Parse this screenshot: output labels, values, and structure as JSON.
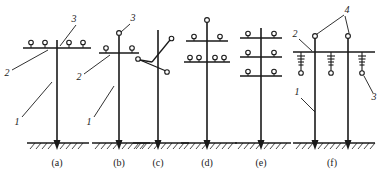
{
  "figure": {
    "stroke_color": "#1a1a1a",
    "background_color": "#ffffff",
    "insulator_fill": "#ffffff"
  },
  "callout_labels": {
    "pole": "1",
    "crossarm": "2",
    "pin_insulator": "3",
    "suspension_insulator_string": "3",
    "conductor_support": "4"
  },
  "panels": [
    {
      "id": "a",
      "caption": "(a)",
      "pole_count": 1,
      "crossarm_count": 1,
      "top_insulator": false,
      "insulator_total": 4,
      "crossarms": [
        {
          "level": 1,
          "insulators_left": 2,
          "insulators_right": 2
        }
      ],
      "callouts": [
        {
          "text": "1",
          "target": "pole"
        },
        {
          "text": "2",
          "target": "crossarm"
        },
        {
          "text": "3",
          "target": "pin-insulator"
        }
      ]
    },
    {
      "id": "b",
      "caption": "(b)",
      "pole_count": 1,
      "crossarm_count": 1,
      "top_insulator": true,
      "insulator_total": 3,
      "crossarms": [
        {
          "level": 1,
          "insulators_left": 1,
          "insulators_right": 1
        }
      ],
      "callouts": [
        {
          "text": "1",
          "target": "pole"
        },
        {
          "text": "2",
          "target": "crossarm"
        },
        {
          "text": "3",
          "target": "top-pin-insulator"
        }
      ]
    },
    {
      "id": "c",
      "caption": "(c)",
      "pole_count": 1,
      "crossarm_count": 0,
      "arm_type": "delta-angled-brackets",
      "insulator_total": 3,
      "arms": [
        {
          "position": "upper-right",
          "insulators": 1
        },
        {
          "position": "middle-left",
          "insulators": 1
        },
        {
          "position": "lower-right",
          "insulators": 1
        }
      ],
      "callouts": []
    },
    {
      "id": "d",
      "caption": "(d)",
      "pole_count": 1,
      "crossarm_count": 2,
      "top_insulator": true,
      "insulator_total": 7,
      "crossarms": [
        {
          "level": 1,
          "insulators_left": 1,
          "insulators_right": 1
        },
        {
          "level": 2,
          "insulators_left": 2,
          "insulators_right": 2
        }
      ],
      "callouts": []
    },
    {
      "id": "e",
      "caption": "(e)",
      "pole_count": 1,
      "crossarm_count": 3,
      "top_insulator": false,
      "insulator_total": 6,
      "crossarms": [
        {
          "level": 1,
          "insulators_left": 1,
          "insulators_right": 1
        },
        {
          "level": 2,
          "insulators_left": 1,
          "insulators_right": 1
        },
        {
          "level": 3,
          "insulators_left": 1,
          "insulators_right": 1
        }
      ],
      "callouts": []
    },
    {
      "id": "f",
      "caption": "(f)",
      "pole_count": 2,
      "crossarm_count": 1,
      "structure": "H-frame double pole",
      "top_insulator": true,
      "suspension_string_count": 3,
      "suspension_string_discs": 4,
      "callouts": [
        {
          "text": "1",
          "target": "pole"
        },
        {
          "text": "2",
          "target": "crossarm"
        },
        {
          "text": "3",
          "target": "suspension-insulator-string"
        },
        {
          "text": "4",
          "target": "conductor-support-insulator"
        }
      ]
    }
  ]
}
